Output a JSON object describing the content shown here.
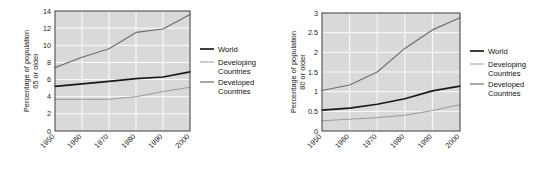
{
  "figure": {
    "panel_count": 2,
    "background_color": "#ffffff",
    "plot_background_color": "#d9d9d9",
    "gridline_color": "#ffffff",
    "axis_border_color": "#4d4d4d"
  },
  "series_style": {
    "world": {
      "color": "#1a1a1a",
      "width": 1.7,
      "label": "World"
    },
    "developing": {
      "color": "#9a9a9a",
      "width": 1.0,
      "label": "Developing Countries"
    },
    "developed": {
      "color": "#6e6e6e",
      "width": 1.2,
      "label": "Developed Countries"
    }
  },
  "legend": {
    "items": [
      {
        "label": "World",
        "color": "#1a1a1a",
        "width": 1.7
      },
      {
        "label_line1": "Developing",
        "label_line2": "Countries",
        "label": "Developing Countries",
        "color": "#9a9a9a",
        "width": 1.0
      },
      {
        "label_line1": "Developed",
        "label_line2": "Countries",
        "label": "Developed Countries",
        "color": "#6e6e6e",
        "width": 1.2
      }
    ]
  },
  "chart_data": [
    {
      "type": "line",
      "panel": "left",
      "title": "",
      "xlabel": "",
      "ylabel": "Percentage of population 65 or older",
      "ylabel_line1": "Percentage of population",
      "ylabel_line2": "65 or older",
      "x": [
        1950,
        1960,
        1970,
        1980,
        1990,
        2000
      ],
      "categories": [
        "1950",
        "1960",
        "1970",
        "1980",
        "1990",
        "2000"
      ],
      "xtick_labels": [
        "1950",
        "1960",
        "1970",
        "1980",
        "1990",
        "2000"
      ],
      "ytick_labels": [
        "0",
        "2",
        "4",
        "6",
        "8",
        "10",
        "12",
        "14"
      ],
      "yticks": [
        0,
        2,
        4,
        6,
        8,
        10,
        12,
        14
      ],
      "ylim": [
        0,
        14
      ],
      "xlim": [
        1950,
        2000
      ],
      "grid": true,
      "legend_position": "right",
      "series": [
        {
          "name": "World",
          "values": [
            5.2,
            5.5,
            5.8,
            6.1,
            6.3,
            6.9
          ]
        },
        {
          "name": "Developing Countries",
          "values": [
            3.7,
            3.7,
            3.7,
            4.0,
            4.6,
            5.1
          ]
        },
        {
          "name": "Developed Countries",
          "values": [
            7.4,
            8.6,
            9.6,
            11.5,
            11.9,
            13.6
          ]
        }
      ]
    },
    {
      "type": "line",
      "panel": "right",
      "title": "",
      "xlabel": "",
      "ylabel": "Percentage of population 80 or older",
      "ylabel_line1": "Percentage of population",
      "ylabel_line2": "80 or older",
      "x": [
        1950,
        1960,
        1970,
        1980,
        1990,
        2000
      ],
      "categories": [
        "1950",
        "1960",
        "1970",
        "1980",
        "1990",
        "2000"
      ],
      "xtick_labels": [
        "1950",
        "1960",
        "1970",
        "1980",
        "1990",
        "2000"
      ],
      "ytick_labels": [
        "0",
        "0.5",
        "1",
        "1.5",
        "2",
        "2.5",
        "3"
      ],
      "yticks": [
        0,
        0.5,
        1,
        1.5,
        2,
        2.5,
        3
      ],
      "ylim": [
        0,
        3
      ],
      "xlim": [
        1950,
        2000
      ],
      "grid": true,
      "legend_position": "right",
      "series": [
        {
          "name": "World",
          "values": [
            0.53,
            0.58,
            0.68,
            0.82,
            1.02,
            1.14
          ]
        },
        {
          "name": "Developing Countries",
          "values": [
            0.26,
            0.3,
            0.34,
            0.4,
            0.52,
            0.67
          ]
        },
        {
          "name": "Developed Countries",
          "values": [
            1.03,
            1.17,
            1.5,
            2.1,
            2.57,
            2.88
          ]
        }
      ]
    }
  ]
}
